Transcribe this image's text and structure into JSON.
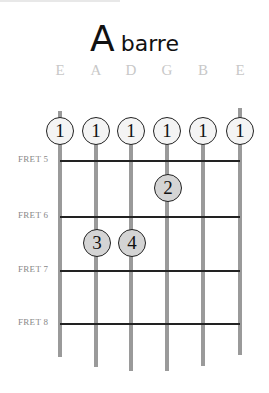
{
  "title": {
    "root": "A",
    "quality": "barre"
  },
  "strings": [
    {
      "name": "E",
      "x": 60,
      "top": 111,
      "bottom": 357
    },
    {
      "name": "A",
      "x": 96,
      "top": 120,
      "bottom": 367
    },
    {
      "name": "D",
      "x": 131,
      "top": 120,
      "bottom": 371
    },
    {
      "name": "G",
      "x": 167,
      "top": 120,
      "bottom": 371
    },
    {
      "name": "B",
      "x": 203,
      "top": 120,
      "bottom": 366
    },
    {
      "name": "E",
      "x": 240,
      "top": 108,
      "bottom": 355
    }
  ],
  "frets": [
    {
      "label": "FRET 5",
      "y": 161
    },
    {
      "label": "FRET 6",
      "y": 217
    },
    {
      "label": "FRET 7",
      "y": 271
    },
    {
      "label": "FRET 8",
      "y": 324
    }
  ],
  "fingers": [
    {
      "finger": "1",
      "string": 0,
      "x": 60,
      "y": 131,
      "style": "light"
    },
    {
      "finger": "1",
      "string": 1,
      "x": 96,
      "y": 131,
      "style": "light"
    },
    {
      "finger": "1",
      "string": 2,
      "x": 131,
      "y": 131,
      "style": "light"
    },
    {
      "finger": "1",
      "string": 3,
      "x": 167,
      "y": 131,
      "style": "light"
    },
    {
      "finger": "1",
      "string": 4,
      "x": 203,
      "y": 131,
      "style": "light"
    },
    {
      "finger": "1",
      "string": 5,
      "x": 240,
      "y": 131,
      "style": "light"
    },
    {
      "finger": "2",
      "string": 3,
      "x": 168,
      "y": 188,
      "style": "grey"
    },
    {
      "finger": "3",
      "string": 1,
      "x": 97,
      "y": 243,
      "style": "grey"
    },
    {
      "finger": "4",
      "string": 2,
      "x": 132,
      "y": 243,
      "style": "grey"
    }
  ],
  "colors": {
    "string": "#9a9a9a",
    "fret": "#222222",
    "label": "#c8c8c8",
    "dot_light": "#f4f4f4",
    "dot_grey": "#d4d4d4"
  }
}
